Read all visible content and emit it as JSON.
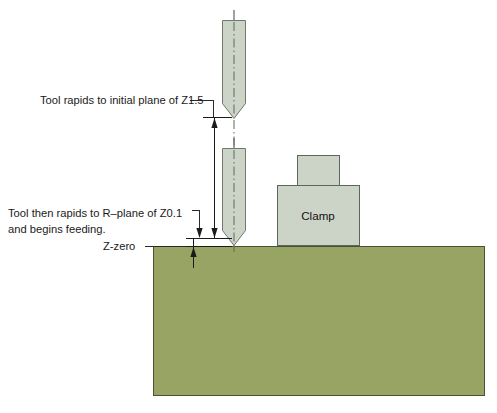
{
  "diagram": {
    "annotations": [
      {
        "id": "initial-plane",
        "text": "Tool rapids to initial plane of Z1.5",
        "value": "Z1.5",
        "x": 40,
        "y": 101
      },
      {
        "id": "r-plane-line1",
        "text": "Tool  then rapids to R–plane of Z0.1",
        "value": "Z0.1",
        "x": 8,
        "y": 214
      },
      {
        "id": "r-plane-line2",
        "text": "and begins feeding.",
        "x": 8,
        "y": 230
      },
      {
        "id": "z-zero",
        "text": "Z-zero",
        "x": 103,
        "y": 247
      }
    ],
    "clamp": {
      "label": "Clamp",
      "label_x": 318,
      "label_y": 216
    },
    "colors": {
      "workpiece_fill": "#97a464",
      "workpiece_stroke": "#4c5136",
      "tool_fill": "#ccd4c8",
      "tool_stroke": "#6f7a6d",
      "clamp_fill": "#ccd4c8",
      "clamp_stroke": "#5d665c",
      "line": "#1a1a1a",
      "background": "#ffffff"
    },
    "geometry": {
      "workpiece": {
        "x": 153,
        "y": 246,
        "width": 332,
        "height": 150
      },
      "tool_upper": {
        "x": 222,
        "y": 20,
        "width": 23,
        "height": 98
      },
      "tool_lower": {
        "x": 222,
        "y": 148,
        "width": 23,
        "height": 97
      },
      "clamp_upper": {
        "x": 297,
        "y": 155,
        "width": 43,
        "height": 30
      },
      "clamp_lower": {
        "x": 277,
        "y": 185,
        "width": 83,
        "height": 61
      },
      "initial_plane_y": 117,
      "r_plane_y": 238,
      "z_zero_y": 246,
      "tool_axis_x": 234
    }
  }
}
